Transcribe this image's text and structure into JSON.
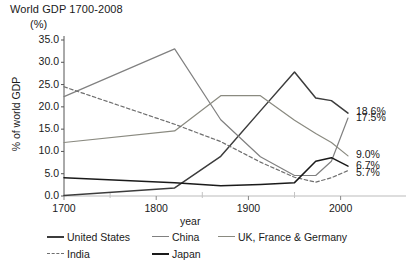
{
  "chart": {
    "title": "World GDP 1700-2008",
    "unit_note": "(%)",
    "xlabel": "year",
    "ylabel": "% of world GDP"
  },
  "chart_data": {
    "type": "line",
    "title": "World GDP 1700-2008",
    "subtitle": "(%)",
    "xlabel": "year",
    "ylabel": "% of world GDP",
    "xlim": [
      1700,
      2008
    ],
    "ylim": [
      0.0,
      35.0
    ],
    "yticks": [
      "0.0",
      "5.0",
      "10.0",
      "15.0",
      "20.0",
      "25.0",
      "30.0",
      "35.0"
    ],
    "ytick_values": [
      0.0,
      5.0,
      10.0,
      15.0,
      20.0,
      25.0,
      30.0,
      35.0
    ],
    "xticks": [
      "1700",
      "1800",
      "1900",
      "2000"
    ],
    "xtick_values": [
      1700,
      1800,
      1900,
      2000
    ],
    "xminor_ticks": [
      1750,
      1850,
      1950
    ],
    "grid": false,
    "legend_position": "bottom",
    "series": [
      {
        "name": "United States",
        "color": "#3c3c3c",
        "style": "solid",
        "x": [
          1700,
          1820,
          1870,
          1913,
          1950,
          1973,
          1990,
          2008
        ],
        "values": [
          0.1,
          1.8,
          8.9,
          19.1,
          27.8,
          22.0,
          21.4,
          18.6
        ],
        "end_label": "18.6%"
      },
      {
        "name": "China",
        "color": "#808080",
        "style": "solid",
        "x": [
          1700,
          1820,
          1870,
          1913,
          1950,
          1973,
          1990,
          2008
        ],
        "values": [
          22.3,
          33.0,
          17.1,
          8.8,
          4.6,
          4.6,
          7.8,
          17.5
        ],
        "end_label": "17.5%"
      },
      {
        "name": "UK, France & Germany",
        "color": "#8a8a80",
        "style": "solid",
        "x": [
          1700,
          1820,
          1870,
          1913,
          1950,
          1973,
          1990,
          2008
        ],
        "values": [
          12.0,
          14.6,
          22.5,
          22.5,
          17.0,
          14.0,
          12.0,
          9.0
        ],
        "end_label": "9.0%"
      },
      {
        "name": "India",
        "color": "#6f6f6f",
        "style": "dashed",
        "x": [
          1700,
          1820,
          1870,
          1913,
          1950,
          1973,
          1990,
          2008
        ],
        "values": [
          24.5,
          16.1,
          12.2,
          7.6,
          4.2,
          3.1,
          4.1,
          5.7
        ],
        "end_label": "5.7%"
      },
      {
        "name": "Japan",
        "color": "#1a1a1a",
        "style": "solid",
        "x": [
          1700,
          1820,
          1870,
          1913,
          1950,
          1973,
          1990,
          2008
        ],
        "values": [
          4.1,
          3.0,
          2.3,
          2.6,
          3.0,
          7.8,
          8.6,
          6.7
        ],
        "end_label": "6.7%"
      }
    ],
    "end_labels": [
      "18.6%",
      "17.5%",
      "9.0%",
      "6.7%",
      "5.7%"
    ]
  },
  "legend": {
    "row1": [
      {
        "label": "United States",
        "style": "solid",
        "color": "#3c3c3c"
      },
      {
        "label": "China",
        "style": "solid",
        "color": "#808080"
      },
      {
        "label": "UK, France & Germany",
        "style": "solid",
        "color": "#8a8a80"
      }
    ],
    "row2": [
      {
        "label": "India",
        "style": "dashed",
        "color": "#6f6f6f"
      },
      {
        "label": "Japan",
        "style": "solid",
        "color": "#1a1a1a"
      }
    ]
  }
}
